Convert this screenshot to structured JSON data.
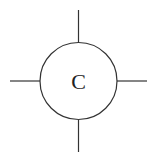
{
  "diagram": {
    "node": {
      "label": "C",
      "shape": "circle",
      "stroke_color": "#333333",
      "fill_color": "#ffffff"
    },
    "connectors": [
      "top",
      "right",
      "bottom",
      "left"
    ]
  }
}
